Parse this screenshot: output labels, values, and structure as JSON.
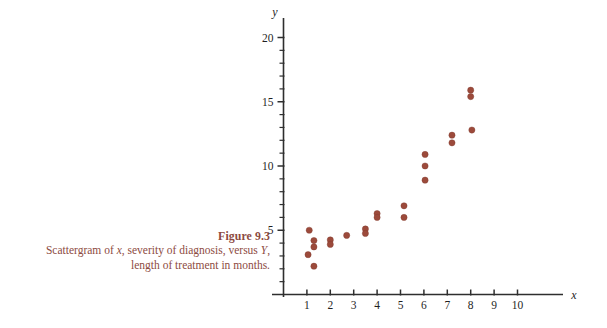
{
  "figure": {
    "title": "Figure 9.3",
    "caption_line1": "Scattergram of ",
    "caption_x": "x",
    "caption_line2": ", severity of diagnosis,",
    "caption_line3": "versus ",
    "caption_Y": "Y",
    "caption_line4": ", length of treatment in",
    "caption_line5": "months.",
    "caption_color": "#8d4b42"
  },
  "chart_data": {
    "type": "scatter",
    "title": "Figure 9.3",
    "subtitle": "Scattergram of x, severity of diagnosis, versus Y, length of treatment in months.",
    "xlabel": "x",
    "ylabel": "y",
    "xlim": [
      0,
      10.6
    ],
    "ylim": [
      0,
      20.8
    ],
    "xticks": [
      1,
      2,
      3,
      4,
      5,
      6,
      7,
      8,
      9,
      10
    ],
    "xtick_labels": [
      "1",
      "2",
      "3",
      "4",
      "5",
      "6",
      "7",
      "8",
      "9",
      "10"
    ],
    "yticks_major": [
      5,
      10,
      15,
      20
    ],
    "ytick_labels": [
      "5",
      "10",
      "15",
      "20"
    ],
    "yticks_minor": [
      1,
      2,
      3,
      4,
      6,
      7,
      8,
      9,
      11,
      12,
      13,
      14,
      16,
      17,
      18,
      19
    ],
    "grid": false,
    "legend": null,
    "marker_color": "#9c4a3b",
    "marker_size": 4.2,
    "points": [
      {
        "x": 1.1,
        "y": 5.0
      },
      {
        "x": 1.05,
        "y": 3.1
      },
      {
        "x": 1.3,
        "y": 4.2
      },
      {
        "x": 1.3,
        "y": 3.7
      },
      {
        "x": 1.3,
        "y": 2.2
      },
      {
        "x": 2.0,
        "y": 4.25
      },
      {
        "x": 2.0,
        "y": 3.9
      },
      {
        "x": 2.7,
        "y": 4.6
      },
      {
        "x": 3.5,
        "y": 5.1
      },
      {
        "x": 3.5,
        "y": 4.75
      },
      {
        "x": 4.0,
        "y": 6.3
      },
      {
        "x": 4.0,
        "y": 6.0
      },
      {
        "x": 5.15,
        "y": 6.9
      },
      {
        "x": 5.15,
        "y": 6.0
      },
      {
        "x": 6.05,
        "y": 10.9
      },
      {
        "x": 6.05,
        "y": 10.0
      },
      {
        "x": 6.05,
        "y": 8.9
      },
      {
        "x": 7.2,
        "y": 12.4
      },
      {
        "x": 7.2,
        "y": 11.8
      },
      {
        "x": 8.0,
        "y": 15.9
      },
      {
        "x": 8.0,
        "y": 15.4
      },
      {
        "x": 8.05,
        "y": 12.8
      }
    ]
  }
}
